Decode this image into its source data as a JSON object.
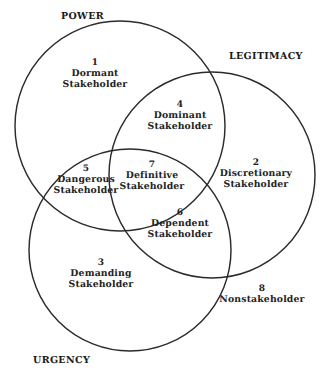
{
  "diagram": {
    "type": "venn-3-circle",
    "title_visible": false,
    "background_color": "#ffffff",
    "stroke_color": "#2b2b2b",
    "text_color": "#232323",
    "circles": [
      {
        "key": "power",
        "label": "POWER",
        "cx": 120,
        "cy": 126,
        "r": 105
      },
      {
        "key": "legitimacy",
        "label": "LEGITIMACY",
        "cx": 212,
        "cy": 175,
        "r": 103
      },
      {
        "key": "urgency",
        "label": "URGENCY",
        "cx": 130,
        "cy": 250,
        "r": 101
      }
    ],
    "axis_labels": [
      {
        "key": "power",
        "text": "POWER",
        "x": 61,
        "y": 12
      },
      {
        "key": "legitimacy",
        "text": "LEGITIMACY",
        "x": 229,
        "y": 52
      },
      {
        "key": "urgency",
        "text": "URGENCY",
        "x": 33,
        "y": 356
      }
    ],
    "regions": [
      {
        "key": "dormant",
        "number": "1",
        "lines": [
          "Dormant",
          "Stakeholder"
        ],
        "sets": [
          "power"
        ],
        "x": 95,
        "y": 58
      },
      {
        "key": "dominant",
        "number": "4",
        "lines": [
          "Dominant",
          "Stakeholder"
        ],
        "sets": [
          "power",
          "legitimacy"
        ],
        "x": 180,
        "y": 100
      },
      {
        "key": "discretionary",
        "number": "2",
        "lines": [
          "Discretionary",
          "Stakeholder"
        ],
        "sets": [
          "legitimacy"
        ],
        "x": 256,
        "y": 158
      },
      {
        "key": "dangerous",
        "number": "5",
        "lines": [
          "Dangerous",
          "Stakeholder"
        ],
        "sets": [
          "power",
          "urgency"
        ],
        "x": 86,
        "y": 164
      },
      {
        "key": "definitive",
        "number": "7",
        "lines": [
          "Definitive",
          "Stakeholder"
        ],
        "sets": [
          "power",
          "legitimacy",
          "urgency"
        ],
        "x": 152,
        "y": 160
      },
      {
        "key": "dependent",
        "number": "6",
        "lines": [
          "Dependent",
          "Stakeholder"
        ],
        "sets": [
          "legitimacy",
          "urgency"
        ],
        "x": 180,
        "y": 208
      },
      {
        "key": "demanding",
        "number": "3",
        "lines": [
          "Demanding",
          "Stakeholder"
        ],
        "sets": [
          "urgency"
        ],
        "x": 101,
        "y": 258
      },
      {
        "key": "nonstakeholder",
        "number": "8",
        "lines": [
          "Nonstakeholder"
        ],
        "sets": [],
        "x": 262,
        "y": 284
      }
    ]
  }
}
